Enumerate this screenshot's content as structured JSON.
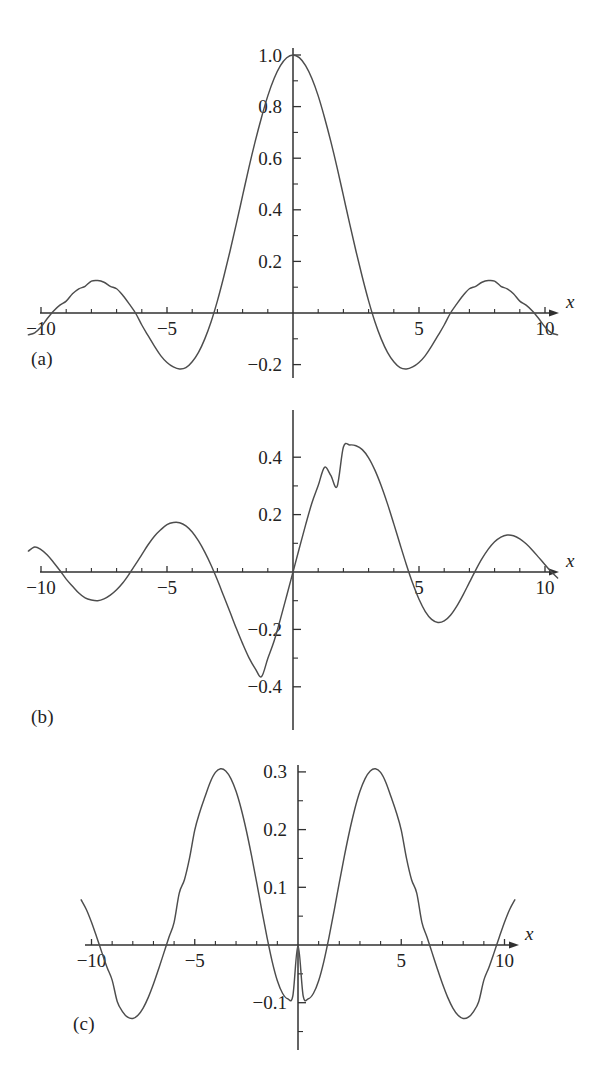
{
  "figure": {
    "background": "#ffffff",
    "curve_color": "#4d4d4d",
    "axis_color": "#303030",
    "panel_labels": {
      "a": "(a)",
      "b": "(b)",
      "c": "(c)"
    }
  },
  "chart_data": [
    {
      "id": "a",
      "type": "line",
      "title": "",
      "xlabel": "x",
      "ylabel": "",
      "xlim": [
        -10.6,
        10.6
      ],
      "ylim": [
        -0.28,
        1.06
      ],
      "grid": false,
      "legend": null,
      "panel_label": "(a)",
      "xticks": [
        -10,
        -5,
        5,
        10
      ],
      "xticklabels": [
        "−10",
        "−5",
        "5",
        "10"
      ],
      "xminorticks": [
        -9,
        -8,
        -7,
        -6,
        -4,
        -3,
        -2,
        -1,
        1,
        2,
        3,
        4,
        6,
        7,
        8,
        9
      ],
      "yticks": [
        0.2,
        0.4,
        0.6,
        0.8,
        1.0,
        -0.2
      ],
      "yticklabels": [
        "0.2",
        "0.4",
        "0.6",
        "0.8",
        "1.0",
        "−0.2"
      ],
      "yminorticks": [
        0.1,
        0.3,
        0.5,
        0.7,
        0.9,
        -0.1
      ],
      "series": [
        {
          "name": "j0(x) = sin(x)/x",
          "x": [
            -10.5,
            -10.25,
            -10,
            -9.75,
            -9.5,
            -9.25,
            -9,
            -8.75,
            -8.5,
            -8.25,
            -8,
            -7.75,
            -7.5,
            -7.25,
            -7,
            -6.75,
            -6.5,
            -6.25,
            -6,
            -5.75,
            -5.5,
            -5.25,
            -5,
            -4.75,
            -4.5,
            -4.25,
            -4,
            -3.75,
            -3.5,
            -3.25,
            -3,
            -2.75,
            -2.5,
            -2.25,
            -2,
            -1.75,
            -1.5,
            -1.25,
            -1,
            -0.75,
            -0.5,
            -0.25,
            0,
            0.25,
            0.5,
            0.75,
            1,
            1.25,
            1.5,
            1.75,
            2,
            2.25,
            2.5,
            2.75,
            3,
            3.25,
            3.5,
            3.75,
            4,
            4.25,
            4.5,
            4.75,
            5,
            5.25,
            5.5,
            5.75,
            6,
            6.25,
            6.5,
            6.75,
            7,
            7.25,
            7.5,
            7.75,
            8,
            8.25,
            8.5,
            8.75,
            9,
            9.25,
            9.5,
            9.75,
            10,
            10.25,
            10.5
          ],
          "y": [
            -0.0846,
            -0.0766,
            -0.0544,
            -0.0215,
            0.0079,
            0.0306,
            0.0459,
            0.0745,
            0.0938,
            0.1035,
            0.1237,
            0.1259,
            0.1191,
            0.1036,
            0.0939,
            0.0678,
            0.0353,
            0.0,
            -0.0466,
            -0.0879,
            -0.1283,
            -0.165,
            -0.1918,
            -0.209,
            -0.2172,
            -0.2121,
            -0.1892,
            -0.1527,
            -0.1002,
            -0.0339,
            0.047,
            0.1395,
            0.2394,
            0.3453,
            0.4546,
            0.5635,
            0.665,
            0.758,
            0.8415,
            0.9089,
            0.9589,
            0.9896,
            1.0,
            0.9896,
            0.9589,
            0.9089,
            0.8415,
            0.758,
            0.665,
            0.5635,
            0.4546,
            0.3453,
            0.2394,
            0.1395,
            0.047,
            -0.0339,
            -0.1002,
            -0.1527,
            -0.1892,
            -0.2121,
            -0.2172,
            -0.209,
            -0.1918,
            -0.165,
            -0.1283,
            -0.0879,
            -0.0466,
            0.0,
            0.0353,
            0.0678,
            0.0939,
            0.1036,
            0.1191,
            0.1259,
            0.1237,
            0.1035,
            0.0938,
            0.0745,
            0.0459,
            0.0306,
            0.0079,
            -0.0215,
            -0.0544,
            -0.0766,
            -0.0846
          ]
        }
      ]
    },
    {
      "id": "b",
      "type": "line",
      "title": "",
      "xlabel": "x",
      "ylabel": "",
      "xlim": [
        -10.6,
        10.6
      ],
      "ylim": [
        -0.5,
        0.5
      ],
      "grid": false,
      "legend": null,
      "panel_label": "(b)",
      "xticks": [
        -10,
        -5,
        5,
        10
      ],
      "xticklabels": [
        "−10",
        "−5",
        "5",
        "10"
      ],
      "xminorticks": [
        -9,
        -8,
        -7,
        -6,
        -4,
        -3,
        -2,
        -1,
        1,
        2,
        3,
        4,
        6,
        7,
        8,
        9
      ],
      "yticks": [
        0.2,
        0.4,
        -0.2,
        -0.4
      ],
      "yticklabels": [
        "0.2",
        "0.4",
        "−0.2",
        "−0.4"
      ],
      "yminorticks": [
        0.1,
        0.3,
        -0.1,
        -0.3
      ],
      "series": [
        {
          "name": "j1(x)",
          "x": [
            -10.5,
            -10.25,
            -10,
            -9.75,
            -9.5,
            -9.25,
            -9,
            -8.75,
            -8.5,
            -8.25,
            -8,
            -7.75,
            -7.5,
            -7.25,
            -7,
            -6.75,
            -6.5,
            -6.25,
            -6,
            -5.75,
            -5.5,
            -5.25,
            -5,
            -4.75,
            -4.5,
            -4.25,
            -4,
            -3.75,
            -3.5,
            -3.25,
            -3,
            -2.75,
            -2.5,
            -2.25,
            -2,
            -1.75,
            -1.5,
            -1.25,
            -1,
            -0.75,
            -0.5,
            -0.25,
            0,
            0.25,
            0.5,
            0.75,
            1,
            1.25,
            1.5,
            1.75,
            2,
            2.25,
            2.5,
            2.75,
            3,
            3.25,
            3.5,
            3.75,
            4,
            4.25,
            4.5,
            4.75,
            5,
            5.25,
            5.5,
            5.75,
            6,
            6.25,
            6.5,
            6.75,
            7,
            7.25,
            7.5,
            7.75,
            8,
            8.25,
            8.5,
            8.75,
            9,
            9.25,
            9.5,
            9.75,
            10,
            10.25,
            10.5
          ],
          "y": [
            0.0729,
            0.0873,
            0.0781,
            0.0594,
            0.0333,
            0.0052,
            -0.0247,
            -0.0495,
            -0.0733,
            -0.0903,
            -0.0976,
            -0.1,
            -0.0937,
            -0.0806,
            -0.0618,
            -0.0374,
            -0.0069,
            0.0263,
            0.0609,
            0.095,
            0.1246,
            0.1471,
            0.165,
            0.1724,
            0.1717,
            0.1607,
            0.1392,
            0.1081,
            0.069,
            0.0234,
            -0.0282,
            -0.0838,
            -0.1395,
            -0.1962,
            -0.2496,
            -0.2982,
            -0.3365,
            -0.3647,
            -0.3012,
            -0.2404,
            -0.164,
            -0.0828,
            0.0,
            0.0828,
            0.164,
            0.2404,
            0.3012,
            0.3647,
            0.3365,
            0.2982,
            0.4354,
            0.4426,
            0.44,
            0.4264,
            0.398,
            0.355,
            0.3006,
            0.2373,
            0.1676,
            0.0957,
            0.0255,
            -0.0396,
            -0.0951,
            -0.1377,
            -0.165,
            -0.1759,
            -0.1705,
            -0.1506,
            -0.119,
            -0.0797,
            -0.0364,
            0.0065,
            0.0462,
            0.0796,
            0.1053,
            0.1218,
            0.1287,
            0.1264,
            0.1157,
            0.0984,
            0.0761,
            0.051,
            0.0255,
            0.0005,
            -0.0206
          ]
        }
      ]
    },
    {
      "id": "c",
      "type": "line",
      "title": "",
      "xlabel": "x",
      "ylabel": "",
      "xlim": [
        -10.6,
        10.6
      ],
      "ylim": [
        -0.2,
        0.34
      ],
      "grid": false,
      "legend": null,
      "panel_label": "(c)",
      "xticks": [
        -10,
        -5,
        5,
        10
      ],
      "xticklabels": [
        "−10",
        "−5",
        "5",
        "10"
      ],
      "xminorticks": [
        -9,
        -8,
        -7,
        -6,
        -4,
        -3,
        -2,
        -1,
        1,
        2,
        3,
        4,
        6,
        7,
        8,
        9
      ],
      "yticks": [
        0.1,
        0.2,
        0.3,
        -0.1
      ],
      "yticklabels": [
        "0.1",
        "0.2",
        "0.3",
        "−0.1"
      ],
      "yminorticks": [
        0.05,
        0.15,
        0.25,
        -0.05,
        -0.15
      ],
      "series": [
        {
          "name": "j2(x)",
          "x": [
            -10.5,
            -10.25,
            -10,
            -9.75,
            -9.5,
            -9.25,
            -9,
            -8.75,
            -8.5,
            -8.25,
            -8,
            -7.75,
            -7.5,
            -7.25,
            -7,
            -6.75,
            -6.5,
            -6.25,
            -6,
            -5.75,
            -5.5,
            -5.25,
            -5,
            -4.75,
            -4.5,
            -4.25,
            -4,
            -3.75,
            -3.5,
            -3.25,
            -3,
            -2.75,
            -2.5,
            -2.25,
            -2,
            -1.75,
            -1.5,
            -1.25,
            -1,
            -0.75,
            -0.5,
            -0.25,
            0,
            0.25,
            0.5,
            0.75,
            1,
            1.25,
            1.5,
            1.75,
            2,
            2.25,
            2.5,
            2.75,
            3,
            3.25,
            3.5,
            3.75,
            4,
            4.25,
            4.5,
            4.75,
            5,
            5.25,
            5.5,
            5.75,
            6,
            6.25,
            6.5,
            6.75,
            7,
            7.25,
            7.5,
            7.75,
            8,
            8.25,
            8.5,
            8.75,
            9,
            9.25,
            9.5,
            9.75,
            10,
            10.25,
            10.5
          ],
          "y": [
            0.0782,
            0.0616,
            0.0395,
            0.0139,
            -0.0128,
            -0.0385,
            -0.0609,
            -0.0983,
            -0.1153,
            -0.1251,
            -0.1273,
            -0.1218,
            -0.1093,
            -0.0908,
            -0.0677,
            -0.0416,
            -0.0141,
            0.0133,
            0.0393,
            0.09,
            0.1131,
            0.151,
            0.1991,
            0.231,
            0.2573,
            0.2822,
            0.2991,
            0.3055,
            0.3017,
            0.2884,
            0.2663,
            0.2357,
            0.198,
            0.1548,
            0.1079,
            0.0597,
            0.0133,
            -0.0287,
            -0.062,
            -0.0836,
            -0.0932,
            -0.088,
            0.0,
            -0.088,
            -0.0932,
            -0.0836,
            -0.062,
            -0.0287,
            0.0133,
            0.0597,
            0.1079,
            0.1548,
            0.198,
            0.2357,
            0.2663,
            0.2884,
            0.3017,
            0.3055,
            0.2991,
            0.2822,
            0.2573,
            0.231,
            0.1991,
            0.151,
            0.1131,
            0.09,
            0.0393,
            0.0133,
            -0.0141,
            -0.0416,
            -0.0677,
            -0.0908,
            -0.1093,
            -0.1218,
            -0.1273,
            -0.1251,
            -0.1153,
            -0.0983,
            -0.0609,
            -0.0385,
            -0.0128,
            0.0139,
            0.0395,
            0.0616,
            0.0782
          ]
        }
      ]
    }
  ]
}
